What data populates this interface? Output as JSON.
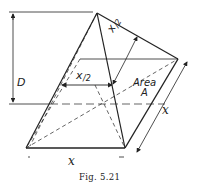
{
  "figure": {
    "caption": "Fig. 5.21",
    "labels": {
      "depth": "D",
      "half_width_front": "x/2",
      "half_width_slant": "x/2",
      "area_line1": "Area",
      "area_line2": "A",
      "base_width": "x",
      "base_depth": "x"
    },
    "colors": {
      "line": "#222222",
      "background": "#ffffff"
    }
  }
}
